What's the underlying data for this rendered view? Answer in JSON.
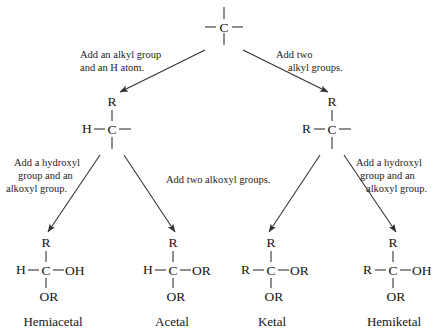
{
  "diagram": {
    "background_color": "#ffffff",
    "line_color": "#2a2a2a",
    "text_color": "#141414"
  },
  "nodes": {
    "root": {
      "name": "carbon-root",
      "center_atom": "C",
      "left": "",
      "right": "",
      "top": "",
      "bottom": ""
    },
    "aldehyde_branch": {
      "name": "alkyl-h-carbon",
      "center_atom": "C",
      "top": "R",
      "left": "H",
      "right": "",
      "bottom": ""
    },
    "ketone_branch": {
      "name": "dialkyl-carbon",
      "center_atom": "C",
      "top": "R",
      "left": "R",
      "right": "",
      "bottom": ""
    },
    "hemiacetal": {
      "name": "hemiacetal",
      "center_atom": "C",
      "top": "R",
      "left": "H",
      "right": "OH",
      "bottom": "OR",
      "caption": "Hemiacetal"
    },
    "acetal": {
      "name": "acetal",
      "center_atom": "C",
      "top": "R",
      "left": "H",
      "right": "OR",
      "bottom": "OR",
      "caption": "Acetal"
    },
    "ketal": {
      "name": "ketal",
      "center_atom": "C",
      "top": "R",
      "left": "R",
      "right": "OR",
      "bottom": "OR",
      "caption": "Ketal"
    },
    "hemiketal": {
      "name": "hemiketal",
      "center_atom": "C",
      "top": "R",
      "left": "R",
      "right": "OH",
      "bottom": "OR",
      "caption": "Hemiketal"
    }
  },
  "annotations": {
    "left_top": {
      "line1": "Add an alkyl group",
      "line2": "and an H atom."
    },
    "right_top": {
      "line1": "Add two",
      "line2": "alkyl groups."
    },
    "far_left": {
      "line1": "Add a hydroxyl",
      "line2": "group and an",
      "line3": "alkoxyl group."
    },
    "middle": {
      "line1": "Add two alkoxyl groups."
    },
    "far_right": {
      "line1": "Add a hydroxyl",
      "line2": "group and an",
      "line3": "alkoxyl group."
    }
  },
  "captions": {
    "hemiacetal": "Hemiacetal",
    "acetal": "Acetal",
    "ketal": "Ketal",
    "hemiketal": "Hemiketal"
  }
}
